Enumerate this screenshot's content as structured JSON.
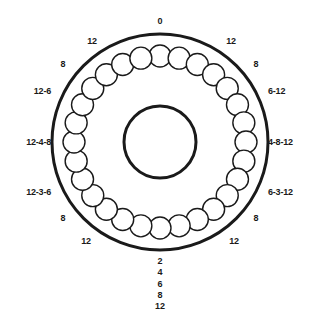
{
  "figure": {
    "colors": {
      "stroke": "#1a1a1a",
      "background": "#ffffff",
      "text": "#1a1a1a"
    },
    "geometry": {
      "center_x": 160,
      "center_y": 142,
      "outer_radius": 108,
      "hub_radius": 36,
      "hole_ring_radius": 86,
      "hole_radius": 11,
      "hole_count": 28,
      "outer_stroke_width": 3,
      "hub_stroke_width": 3,
      "hole_stroke_width": 1.4
    }
  },
  "ring_labels": [
    {
      "id": "top-center",
      "text": "0",
      "x": 160,
      "y": 21,
      "align": "center"
    },
    {
      "id": "top-left",
      "text": "12",
      "x": 92,
      "y": 41,
      "align": "center"
    },
    {
      "id": "top-right",
      "text": "12",
      "x": 231,
      "y": 41,
      "align": "center"
    },
    {
      "id": "upper-left",
      "text": "8",
      "x": 63,
      "y": 64,
      "align": "center"
    },
    {
      "id": "upper-right",
      "text": "8",
      "x": 256,
      "y": 64,
      "align": "center"
    },
    {
      "id": "mid-upper-left",
      "text": "12-6",
      "x": 51,
      "y": 91,
      "align": "right"
    },
    {
      "id": "mid-upper-right",
      "text": "6-12",
      "x": 268,
      "y": 91,
      "align": "left"
    },
    {
      "id": "mid-left",
      "text": "12-4-8",
      "x": 51,
      "y": 142,
      "align": "right"
    },
    {
      "id": "mid-right",
      "text": "4-8-12",
      "x": 268,
      "y": 142,
      "align": "left"
    },
    {
      "id": "mid-lower-left",
      "text": "12-3-6",
      "x": 51,
      "y": 192,
      "align": "right"
    },
    {
      "id": "mid-lower-right",
      "text": "6-3-12",
      "x": 268,
      "y": 192,
      "align": "left"
    },
    {
      "id": "lower-left",
      "text": "8",
      "x": 63,
      "y": 218,
      "align": "center"
    },
    {
      "id": "lower-right",
      "text": "8",
      "x": 256,
      "y": 218,
      "align": "center"
    },
    {
      "id": "bottom-left",
      "text": "12",
      "x": 86,
      "y": 241,
      "align": "center"
    },
    {
      "id": "bottom-right",
      "text": "12",
      "x": 234,
      "y": 241,
      "align": "center"
    }
  ],
  "bottom_stack": {
    "items": [
      "2",
      "4",
      "6",
      "8",
      "12"
    ]
  }
}
